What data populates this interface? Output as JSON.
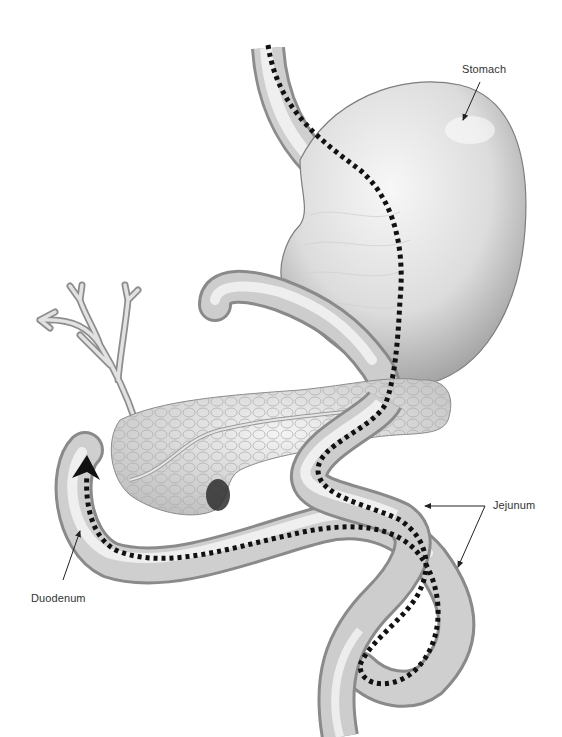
{
  "figure": {
    "labels": {
      "stomach": "Stomach",
      "jejunum": "Jejunum",
      "duodenum": "Duodenum"
    },
    "structures": [
      "esophagus",
      "stomach",
      "pylorus-bulb",
      "bile-duct-tree",
      "pancreas",
      "duodenum",
      "jejunum-loops"
    ],
    "path_indicator": {
      "style": "dotted-line",
      "end_marker": "arrowhead",
      "color": "#111111"
    },
    "colors": {
      "organ_light": "#f2f2f2",
      "organ_mid": "#c8c8c8",
      "organ_dark": "#8a8a8a",
      "outline": "#7a7a7a",
      "background": "#ffffff"
    }
  }
}
